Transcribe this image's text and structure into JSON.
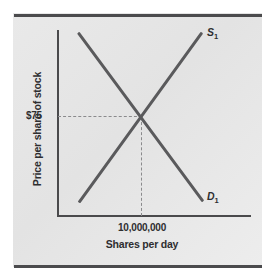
{
  "figure": {
    "kind": "supply-and-demand-line-chart",
    "background_color": "#e7e7e7",
    "page_rule_color": "#4b4b4d",
    "axis_color": "#4a4a4c",
    "curve_color": "#5a5a5c",
    "guide_line_color": "#8a8a8c",
    "text_color": "#2e2e30"
  },
  "axes": {
    "y_title": "Price per share of stock",
    "x_title": "Shares per day",
    "y_tick_label": "$75",
    "x_tick_label": "10,000,000"
  },
  "curves": {
    "supply": {
      "label": "S",
      "subscript": "1"
    },
    "demand": {
      "label": "D",
      "subscript": "1"
    }
  },
  "chart_data": {
    "type": "line",
    "title": "",
    "subtitle": "",
    "xlabel": "Shares per day",
    "ylabel": "Price per share of stock",
    "grid": false,
    "legend_position": "inline-end-of-line",
    "xlim": [
      0,
      1
    ],
    "ylim": [
      0,
      1
    ],
    "xticks": [
      0.43
    ],
    "xtick_labels": [
      "10,000,000"
    ],
    "yticks": [
      0.53
    ],
    "ytick_labels": [
      "$75"
    ],
    "series": [
      {
        "name": "S1",
        "label": "S₁",
        "description": "Upward-sloping supply curve",
        "points": [
          {
            "x": 0.11,
            "y": 0.08
          },
          {
            "x": 0.43,
            "y": 0.53
          },
          {
            "x": 0.75,
            "y": 0.99
          }
        ]
      },
      {
        "name": "D1",
        "label": "D₁",
        "description": "Downward-sloping demand curve",
        "points": [
          {
            "x": 0.11,
            "y": 0.99
          },
          {
            "x": 0.43,
            "y": 0.53
          },
          {
            "x": 0.75,
            "y": 0.08
          }
        ]
      }
    ],
    "annotations": [
      {
        "type": "equilibrium",
        "x": 0.43,
        "y": 0.53,
        "x_label": "10,000,000",
        "y_label": "$75",
        "guides": [
          "horizontal-dashed-to-y-axis",
          "vertical-dashed-to-x-axis"
        ]
      }
    ]
  }
}
